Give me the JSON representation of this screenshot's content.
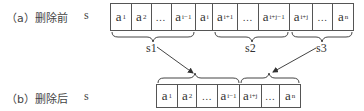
{
  "before": {
    "label": "（a）删除前",
    "var": "s",
    "cells": [
      {
        "base": "a",
        "sub": "1"
      },
      {
        "base": "a",
        "sub": "2"
      },
      {
        "base": "…",
        "sub": ""
      },
      {
        "base": "a",
        "sub": "i−1"
      },
      {
        "base": "a",
        "sub": "i"
      },
      {
        "base": "a",
        "sub": "i+1"
      },
      {
        "base": "…",
        "sub": ""
      },
      {
        "base": "a",
        "sub": "i+j−1"
      },
      {
        "base": "a",
        "sub": "i+j"
      },
      {
        "base": "…",
        "sub": ""
      },
      {
        "base": "a",
        "sub": "n"
      }
    ],
    "groups": [
      "s1",
      "s2",
      "s3"
    ]
  },
  "after": {
    "label": "（b）删除后",
    "var": "s",
    "cells": [
      {
        "base": "a",
        "sub": "1"
      },
      {
        "base": "a",
        "sub": "2"
      },
      {
        "base": "…",
        "sub": ""
      },
      {
        "base": "a",
        "sub": "i−1"
      },
      {
        "base": "a",
        "sub": "i+j"
      },
      {
        "base": "…",
        "sub": ""
      },
      {
        "base": "a",
        "sub": "n"
      }
    ]
  },
  "colors": {
    "line": "#555555",
    "text": "#333333"
  }
}
